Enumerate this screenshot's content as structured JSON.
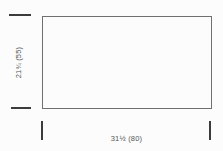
{
  "diagram": {
    "shape": "rectangle",
    "height_dimension": {
      "label": "21¾ (55)"
    },
    "width_dimension": {
      "label": "31½ (80)"
    },
    "colors": {
      "outline": "#707070",
      "tick": "#3c3c3c",
      "text": "#555555",
      "background": "#fcfcfc"
    }
  }
}
